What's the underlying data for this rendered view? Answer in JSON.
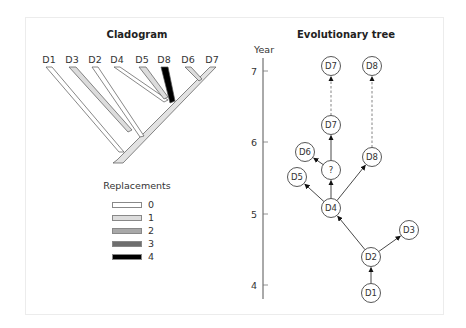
{
  "cladogram": {
    "title": "Cladogram",
    "leaves": [
      {
        "label": "D1",
        "x": 49,
        "replacements": 0
      },
      {
        "label": "D3",
        "x": 72,
        "replacements": 1
      },
      {
        "label": "D2",
        "x": 95,
        "replacements": 0
      },
      {
        "label": "D4",
        "x": 117,
        "replacements": 0
      },
      {
        "label": "D5",
        "x": 142,
        "replacements": 1
      },
      {
        "label": "D8",
        "x": 164,
        "replacements": 4
      },
      {
        "label": "D6",
        "x": 188,
        "replacements": 1
      },
      {
        "label": "D7",
        "x": 212,
        "replacements": 0
      }
    ],
    "legend": {
      "title": "Replacements",
      "items": [
        {
          "label": "0",
          "color": "#ffffff"
        },
        {
          "label": "1",
          "color": "#dcdcdc"
        },
        {
          "label": "2",
          "color": "#a8a8a8"
        },
        {
          "label": "3",
          "color": "#6e6e6e"
        },
        {
          "label": "4",
          "color": "#000000"
        }
      ]
    }
  },
  "tree": {
    "title": "Evolutionary tree",
    "axis": {
      "label": "Year",
      "ticks": [
        {
          "label": "7",
          "y": 71
        },
        {
          "label": "6",
          "y": 142
        },
        {
          "label": "5",
          "y": 214
        },
        {
          "label": "4",
          "y": 285
        }
      ]
    },
    "nodes": [
      {
        "id": "d7top",
        "label": "D7",
        "x": 331,
        "y": 66
      },
      {
        "id": "d8top",
        "label": "D8",
        "x": 372,
        "y": 66
      },
      {
        "id": "d7mid",
        "label": "D7",
        "x": 331,
        "y": 125
      },
      {
        "id": "d6",
        "label": "D6",
        "x": 305,
        "y": 152
      },
      {
        "id": "q",
        "label": "?",
        "x": 331,
        "y": 170
      },
      {
        "id": "d8mid",
        "label": "D8",
        "x": 372,
        "y": 157
      },
      {
        "id": "d5",
        "label": "D5",
        "x": 297,
        "y": 177
      },
      {
        "id": "d4",
        "label": "D4",
        "x": 331,
        "y": 208
      },
      {
        "id": "d3",
        "label": "D3",
        "x": 409,
        "y": 230
      },
      {
        "id": "d2",
        "label": "D2",
        "x": 371,
        "y": 257
      },
      {
        "id": "d1",
        "label": "D1",
        "x": 371,
        "y": 293
      }
    ],
    "edges": [
      {
        "from": "d1",
        "to": "d2",
        "style": "solid"
      },
      {
        "from": "d2",
        "to": "d3",
        "style": "solid"
      },
      {
        "from": "d2",
        "to": "d4",
        "style": "solid"
      },
      {
        "from": "d4",
        "to": "d5",
        "style": "solid"
      },
      {
        "from": "d4",
        "to": "q",
        "style": "solid"
      },
      {
        "from": "d4",
        "to": "d8mid",
        "style": "solid"
      },
      {
        "from": "q",
        "to": "d6",
        "style": "solid"
      },
      {
        "from": "q",
        "to": "d7mid",
        "style": "solid"
      },
      {
        "from": "d7mid",
        "to": "d7top",
        "style": "dashed"
      },
      {
        "from": "d8mid",
        "to": "d8top",
        "style": "dashed"
      }
    ]
  }
}
